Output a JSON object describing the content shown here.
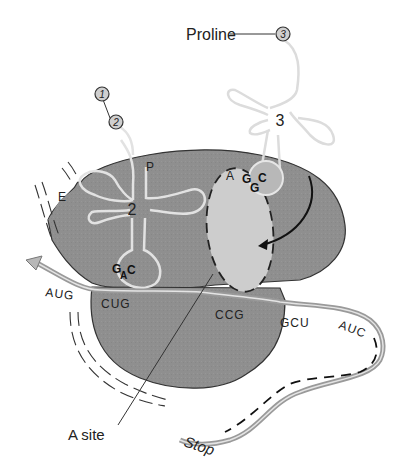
{
  "diagram": {
    "labels": {
      "amino_acid": "Proline",
      "a_site_callout": "A site",
      "stop": "Stop",
      "site_e": "E",
      "site_p": "P",
      "site_a": "A"
    },
    "amino_acid_chain": {
      "residue_1": "1",
      "residue_2": "2",
      "incoming_residue": "3"
    },
    "trnas": [
      {
        "number": "2",
        "site": "P",
        "anticodon": [
          "G",
          "A",
          "C"
        ]
      },
      {
        "number": "3",
        "site": "A",
        "anticodon": [
          "G",
          "G",
          "C"
        ]
      }
    ],
    "mrna_codons": [
      "AUG",
      "CUG",
      "CCG",
      "GCU",
      "AUC"
    ],
    "colors": {
      "ribosome": "#8e8e8e",
      "a_site_pocket": "#cfcfcf",
      "trna_line": "#dadada",
      "mrna": "#a9a9a9",
      "ink": "#222222"
    }
  }
}
